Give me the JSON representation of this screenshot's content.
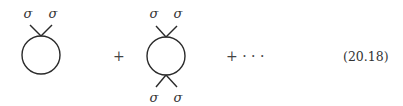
{
  "equation": {
    "number": "(20.18)",
    "terms": [
      {
        "type": "vertex-loop",
        "external_legs_top": [
          "σ",
          "σ"
        ],
        "external_legs_bottom": []
      },
      {
        "operator": "+"
      },
      {
        "type": "vertex-loop",
        "external_legs_top": [
          "σ",
          "σ"
        ],
        "external_legs_bottom": [
          "σ",
          "σ"
        ]
      },
      {
        "operator": "+ · · ·"
      }
    ]
  },
  "colors": {
    "line": "#2a2a2a",
    "text": "#333333",
    "background": "#ffffff"
  }
}
